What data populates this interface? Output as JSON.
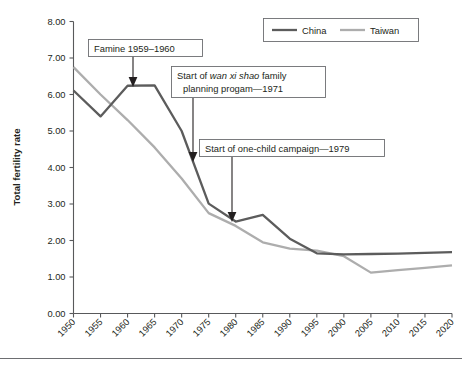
{
  "chart_data": {
    "type": "line",
    "title": "",
    "xlabel": "",
    "ylabel": "Total fertility rate",
    "xlim": [
      1950,
      2020
    ],
    "ylim": [
      0.0,
      8.0
    ],
    "grid": false,
    "legend_position": "top-right",
    "x": [
      1950,
      1955,
      1960,
      1965,
      1970,
      1975,
      1980,
      1985,
      1990,
      1995,
      2000,
      2005,
      2010,
      2015,
      2020
    ],
    "xtick_labels": [
      "1950",
      "1955",
      "1960",
      "1965",
      "1970",
      "1975",
      "1980",
      "1985",
      "1990",
      "1995",
      "2000",
      "2005",
      "2010",
      "2015",
      "2020"
    ],
    "ytick_labels": [
      "0.00",
      "1.00",
      "2.00",
      "3.00",
      "4.00",
      "5.00",
      "6.00",
      "7.00",
      "8.00"
    ],
    "ytick_values": [
      0.0,
      1.0,
      2.0,
      3.0,
      4.0,
      5.0,
      6.0,
      7.0,
      8.0
    ],
    "series": [
      {
        "name": "China",
        "color": "#5c5c5c",
        "values": [
          6.11,
          5.4,
          6.24,
          6.25,
          5.0,
          3.01,
          2.52,
          2.7,
          2.05,
          1.65,
          1.62,
          1.63,
          1.64,
          1.66,
          1.68
        ]
      },
      {
        "name": "Taiwan",
        "color": "#adadad",
        "values": [
          6.75,
          6.0,
          5.3,
          4.55,
          3.7,
          2.75,
          2.4,
          1.95,
          1.78,
          1.72,
          1.57,
          1.12,
          1.19,
          1.25,
          1.32
        ]
      }
    ],
    "annotations": [
      {
        "id": "famine",
        "text": "Famine 1959–1960",
        "target_x": 1960,
        "target_y": 6.24
      },
      {
        "id": "wan-xi-shao",
        "text_parts": [
          {
            "t": "Start of ",
            "style": "normal"
          },
          {
            "t": "wan xi shao",
            "style": "italic"
          },
          {
            "t": " family",
            "style": "normal"
          }
        ],
        "line2": "planning progam—1971",
        "target_x": 1971,
        "target_y": 4.45
      },
      {
        "id": "one-child",
        "text": "Start of one-child campaign—1979",
        "target_x": 1979,
        "target_y": 2.6
      }
    ]
  },
  "legend": {
    "items": [
      {
        "label": "China",
        "color": "#5c5c5c"
      },
      {
        "label": "Taiwan",
        "color": "#adadad"
      }
    ]
  },
  "axes": {
    "y_title": "Total fertility rate"
  },
  "footer": {
    "caption": ""
  },
  "colors": {
    "china": "#5c5c5c",
    "taiwan": "#adadad",
    "axis": "#58595b",
    "text": "#231f20",
    "box_border": "#6d6e71",
    "background": "#ffffff"
  }
}
